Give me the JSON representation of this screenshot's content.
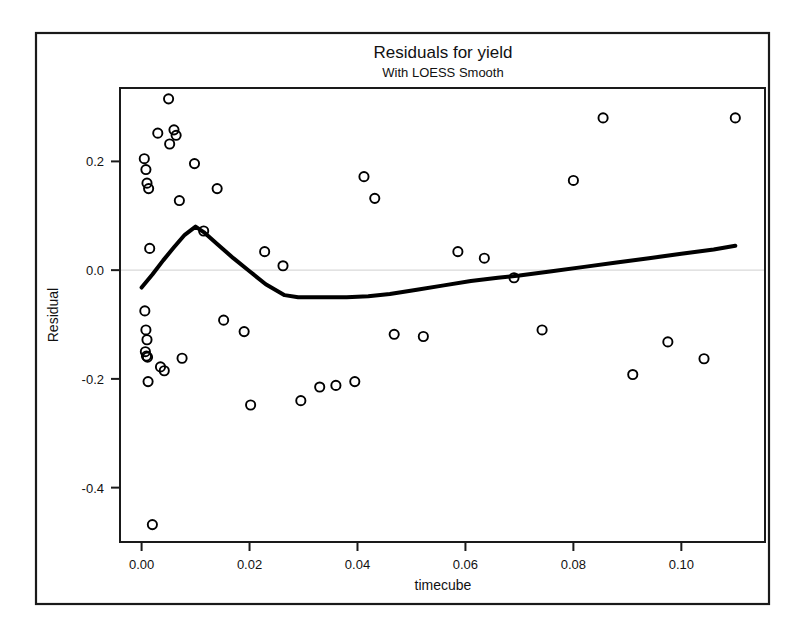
{
  "chart_data": {
    "type": "scatter",
    "title": "Residuals for yield",
    "subtitle": "With LOESS Smooth",
    "xlabel": "timecube",
    "ylabel": "Residual",
    "xlim": [
      -0.004,
      0.1155
    ],
    "ylim": [
      -0.5,
      0.335
    ],
    "xticks": [
      0.0,
      0.02,
      0.04,
      0.06,
      0.08,
      0.1
    ],
    "xtick_labels": [
      "0.00",
      "0.02",
      "0.04",
      "0.06",
      "0.08",
      "0.10"
    ],
    "yticks": [
      0.2,
      0.0,
      -0.2,
      -0.4
    ],
    "ytick_labels": [
      "0.2",
      "0.0",
      "-0.2",
      "-0.4"
    ],
    "grid": false,
    "zero_reference_line": 0.0,
    "marker": "open-circle",
    "marker_color": "#000000",
    "line_color": "#000000",
    "background_color": "#ffffff",
    "points": [
      {
        "x": 0.0005,
        "y": 0.205
      },
      {
        "x": 0.0008,
        "y": 0.185
      },
      {
        "x": 0.001,
        "y": 0.16
      },
      {
        "x": 0.0013,
        "y": 0.15
      },
      {
        "x": 0.0015,
        "y": 0.04
      },
      {
        "x": 0.0006,
        "y": -0.075
      },
      {
        "x": 0.0008,
        "y": -0.11
      },
      {
        "x": 0.001,
        "y": -0.128
      },
      {
        "x": 0.0007,
        "y": -0.15
      },
      {
        "x": 0.0009,
        "y": -0.158
      },
      {
        "x": 0.0011,
        "y": -0.16
      },
      {
        "x": 0.0012,
        "y": -0.205
      },
      {
        "x": 0.002,
        "y": -0.468
      },
      {
        "x": 0.003,
        "y": 0.252
      },
      {
        "x": 0.0035,
        "y": -0.178
      },
      {
        "x": 0.0042,
        "y": -0.185
      },
      {
        "x": 0.005,
        "y": 0.315
      },
      {
        "x": 0.0052,
        "y": 0.232
      },
      {
        "x": 0.006,
        "y": 0.258
      },
      {
        "x": 0.0064,
        "y": 0.248
      },
      {
        "x": 0.007,
        "y": 0.128
      },
      {
        "x": 0.0075,
        "y": -0.162
      },
      {
        "x": 0.0098,
        "y": 0.196
      },
      {
        "x": 0.0115,
        "y": 0.072
      },
      {
        "x": 0.014,
        "y": 0.15
      },
      {
        "x": 0.0152,
        "y": -0.092
      },
      {
        "x": 0.019,
        "y": -0.113
      },
      {
        "x": 0.0202,
        "y": -0.248
      },
      {
        "x": 0.0228,
        "y": 0.034
      },
      {
        "x": 0.0262,
        "y": 0.008
      },
      {
        "x": 0.0295,
        "y": -0.24
      },
      {
        "x": 0.033,
        "y": -0.215
      },
      {
        "x": 0.036,
        "y": -0.212
      },
      {
        "x": 0.0395,
        "y": -0.205
      },
      {
        "x": 0.0412,
        "y": 0.172
      },
      {
        "x": 0.0432,
        "y": 0.132
      },
      {
        "x": 0.0468,
        "y": -0.118
      },
      {
        "x": 0.0522,
        "y": -0.122
      },
      {
        "x": 0.0586,
        "y": 0.034
      },
      {
        "x": 0.0635,
        "y": 0.022
      },
      {
        "x": 0.069,
        "y": -0.014
      },
      {
        "x": 0.0742,
        "y": -0.11
      },
      {
        "x": 0.08,
        "y": 0.165
      },
      {
        "x": 0.0855,
        "y": 0.28
      },
      {
        "x": 0.091,
        "y": -0.192
      },
      {
        "x": 0.0975,
        "y": -0.132
      },
      {
        "x": 0.1042,
        "y": -0.163
      },
      {
        "x": 0.11,
        "y": 0.28
      }
    ],
    "loess_curve": {
      "name": "LOESS Smooth",
      "points": [
        {
          "x": 0.0,
          "y": -0.032
        },
        {
          "x": 0.002,
          "y": -0.008
        },
        {
          "x": 0.004,
          "y": 0.018
        },
        {
          "x": 0.006,
          "y": 0.042
        },
        {
          "x": 0.008,
          "y": 0.065
        },
        {
          "x": 0.01,
          "y": 0.08
        },
        {
          "x": 0.0115,
          "y": 0.07
        },
        {
          "x": 0.014,
          "y": 0.048
        },
        {
          "x": 0.017,
          "y": 0.022
        },
        {
          "x": 0.02,
          "y": -0.002
        },
        {
          "x": 0.023,
          "y": -0.026
        },
        {
          "x": 0.0265,
          "y": -0.046
        },
        {
          "x": 0.029,
          "y": -0.05
        },
        {
          "x": 0.033,
          "y": -0.05
        },
        {
          "x": 0.038,
          "y": -0.05
        },
        {
          "x": 0.042,
          "y": -0.048
        },
        {
          "x": 0.046,
          "y": -0.044
        },
        {
          "x": 0.051,
          "y": -0.036
        },
        {
          "x": 0.056,
          "y": -0.028
        },
        {
          "x": 0.061,
          "y": -0.02
        },
        {
          "x": 0.066,
          "y": -0.014
        },
        {
          "x": 0.07,
          "y": -0.01
        },
        {
          "x": 0.076,
          "y": -0.002
        },
        {
          "x": 0.082,
          "y": 0.006
        },
        {
          "x": 0.088,
          "y": 0.014
        },
        {
          "x": 0.094,
          "y": 0.022
        },
        {
          "x": 0.1,
          "y": 0.03
        },
        {
          "x": 0.106,
          "y": 0.038
        },
        {
          "x": 0.11,
          "y": 0.045
        }
      ]
    }
  }
}
